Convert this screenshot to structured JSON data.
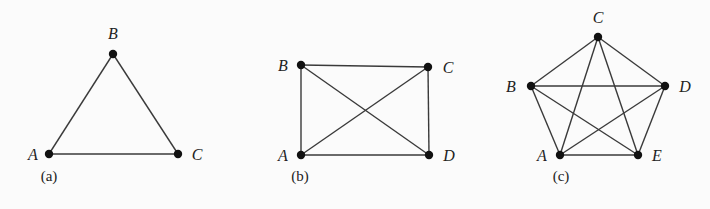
{
  "graphs": [
    {
      "id": "a",
      "caption": "(a)",
      "caption_pos": [
        49,
        181
      ],
      "vertices": [
        {
          "name": "A",
          "x": 49,
          "y": 154,
          "lx": 33,
          "ly": 160
        },
        {
          "name": "B",
          "x": 113,
          "y": 54,
          "lx": 113,
          "ly": 39
        },
        {
          "name": "C",
          "x": 178,
          "y": 154,
          "lx": 197,
          "ly": 160
        }
      ],
      "edges": [
        [
          "A",
          "B"
        ],
        [
          "B",
          "C"
        ],
        [
          "A",
          "C"
        ]
      ]
    },
    {
      "id": "b",
      "caption": "(b)",
      "caption_pos": [
        300,
        181
      ],
      "vertices": [
        {
          "name": "A",
          "x": 301,
          "y": 155,
          "lx": 283,
          "ly": 161
        },
        {
          "name": "B",
          "x": 301,
          "y": 65,
          "lx": 283,
          "ly": 71
        },
        {
          "name": "C",
          "x": 428,
          "y": 67,
          "lx": 448,
          "ly": 73
        },
        {
          "name": "D",
          "x": 429,
          "y": 155,
          "lx": 449,
          "ly": 161
        }
      ],
      "edges": [
        [
          "A",
          "B"
        ],
        [
          "B",
          "C"
        ],
        [
          "C",
          "D"
        ],
        [
          "A",
          "D"
        ],
        [
          "A",
          "C"
        ],
        [
          "B",
          "D"
        ]
      ]
    },
    {
      "id": "c",
      "caption": "(c)",
      "caption_pos": [
        561,
        181
      ],
      "vertices": [
        {
          "name": "A",
          "x": 560,
          "y": 155,
          "lx": 542,
          "ly": 161
        },
        {
          "name": "B",
          "x": 531,
          "y": 86,
          "lx": 511,
          "ly": 92
        },
        {
          "name": "C",
          "x": 598,
          "y": 37,
          "lx": 598,
          "ly": 23
        },
        {
          "name": "D",
          "x": 665,
          "y": 86,
          "lx": 685,
          "ly": 92
        },
        {
          "name": "E",
          "x": 638,
          "y": 155,
          "lx": 657,
          "ly": 161
        }
      ],
      "edges": [
        [
          "A",
          "B"
        ],
        [
          "A",
          "C"
        ],
        [
          "A",
          "D"
        ],
        [
          "A",
          "E"
        ],
        [
          "B",
          "C"
        ],
        [
          "B",
          "D"
        ],
        [
          "B",
          "E"
        ],
        [
          "C",
          "D"
        ],
        [
          "C",
          "E"
        ],
        [
          "D",
          "E"
        ]
      ]
    }
  ]
}
